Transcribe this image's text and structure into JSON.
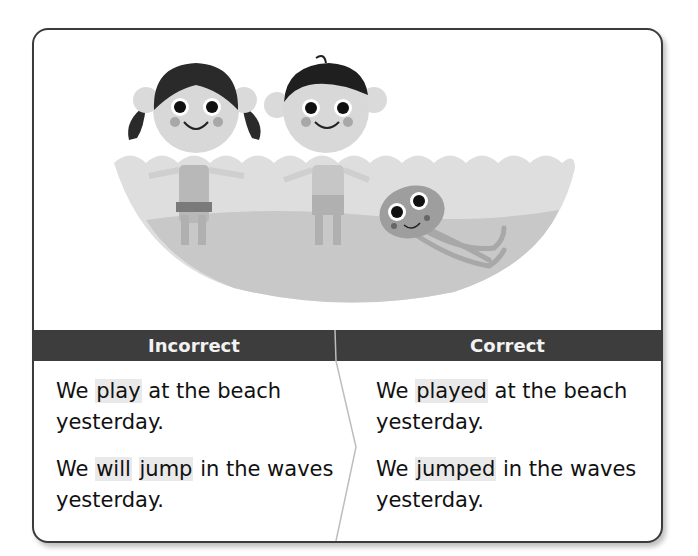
{
  "columns": {
    "incorrect": {
      "header": "Incorrect",
      "sentences": [
        {
          "before": "We ",
          "highlight": "play",
          "after": " at the beach yesterday."
        },
        {
          "before": "We ",
          "highlight": "will",
          "middle": " ",
          "highlight2": "jump",
          "after": " in the waves yesterday."
        }
      ]
    },
    "correct": {
      "header": "Correct",
      "sentences": [
        {
          "before": "We ",
          "highlight": "played",
          "after": " at the beach yesterday."
        },
        {
          "before": "We ",
          "highlight": "jumped",
          "after": " in the waves yesterday."
        }
      ]
    }
  },
  "colors": {
    "header_bg": "#3d3d3d",
    "header_text": "#f2f2f2",
    "highlight": "#e9e9e9",
    "border": "#3b3b3b"
  },
  "illustration": {
    "description": "Two children (a girl with pigtails and a boy) standing in waves at the beach with a smiling jellyfish",
    "characters": [
      "girl",
      "boy",
      "jellyfish"
    ]
  }
}
